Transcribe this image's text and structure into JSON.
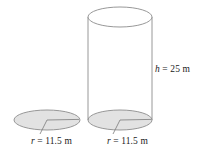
{
  "figure": {
    "type": "geometry-diagram",
    "background_color": "#ffffff",
    "outline_color": "#8c8c8c",
    "fill_color": "#e2e2e2",
    "leader_color": "#8c8c8c",
    "shapes": {
      "standalone_circle": {
        "name": "shaded-circle",
        "filled": true
      },
      "cylinder": {
        "name": "cylinder",
        "top_face_filled": false,
        "bottom_face_filled": true
      }
    },
    "labels": {
      "height": {
        "variable": "h",
        "equals": "=",
        "value": "25",
        "unit": "m",
        "full": "h = 25 m"
      },
      "radius_left": {
        "variable": "r",
        "equals": "=",
        "value": "11.5",
        "unit": "m",
        "full": "r = 11.5 m"
      },
      "radius_right": {
        "variable": "r",
        "equals": "=",
        "value": "11.5",
        "unit": "m",
        "full": "r = 11.5 m"
      }
    }
  }
}
